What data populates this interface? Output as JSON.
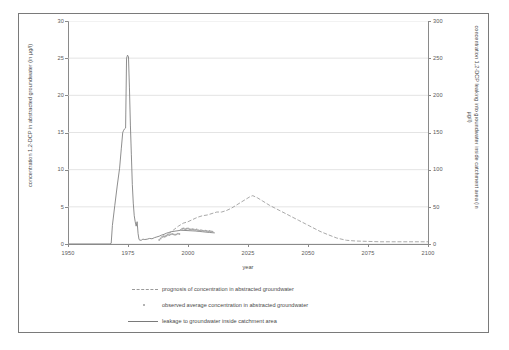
{
  "chart_data": {
    "type": "line",
    "title": "",
    "xlabel": "year",
    "ylabel": "concentration 1,2-DCP in abstracted groundwater (in µg/l)",
    "y2label": "concentration 1,2-DCP leaking into groundwater inside catchment area (in µg/l)",
    "xlim": [
      1950,
      2100
    ],
    "ylim": [
      0,
      30
    ],
    "y2lim": [
      0,
      300
    ],
    "grid": true,
    "legend_position": "below-plot",
    "xticks": [
      1950,
      1975,
      2000,
      2025,
      2050,
      2075,
      2100
    ],
    "xtick_labels": [
      "1950",
      "1975",
      "2000",
      "2025",
      "2050",
      "2075",
      "2100"
    ],
    "yticks": [
      0,
      5,
      10,
      15,
      20,
      25,
      30
    ],
    "ytick_labels": [
      "0",
      "5",
      "10",
      "15",
      "20",
      "25",
      "30"
    ],
    "y2ticks": [
      0,
      50,
      100,
      150,
      200,
      250,
      300
    ],
    "y2tick_labels": [
      "0",
      "50",
      "100",
      "150",
      "200",
      "250",
      "300"
    ],
    "series": [
      {
        "name": "leakage to groundwater inside catchment area",
        "style": "solid",
        "color": "#7a7a7a",
        "axis": "right",
        "x": [
          1950,
          1967.5,
          1968,
          1968.5,
          1969.5,
          1970.5,
          1971.5,
          1972.2,
          1972.8,
          1973.2,
          1973.6,
          1974.0,
          1974.4,
          1974.8,
          1975.2,
          1975.6,
          1976.0,
          1976.4,
          1976.8,
          1977.2,
          1977.6,
          1978.0,
          1978.4,
          1978.8,
          1979.2,
          1979.6,
          1980.0,
          1980.6,
          1981.2,
          1982.0,
          1983.0,
          1984.0,
          1985.0,
          1986.0,
          1987.0,
          1988.0,
          1989.0,
          1990.0,
          1991.0,
          1992.0,
          1993.0,
          1995.0,
          1997.0,
          2000.0,
          2003.0,
          2006.0,
          2009.0,
          2011.0
        ],
        "values": [
          0,
          0,
          1.0,
          25,
          52,
          78,
          102,
          128,
          150,
          153,
          155,
          156,
          250,
          254,
          252,
          210,
          160,
          120,
          80,
          55,
          38,
          30,
          24,
          30,
          14,
          6.0,
          5.0,
          5.2,
          6.5,
          6.0,
          6.5,
          7.5,
          7.0,
          8.5,
          9.5,
          10.5,
          12.0,
          13.0,
          14.5,
          15.5,
          16.5,
          17.5,
          18.5,
          18.0,
          17.5,
          16.5,
          15.5,
          15.0
        ]
      },
      {
        "name": "prognosis of concentration in abstracted groundwater",
        "style": "dashed",
        "color": "#9a9a9a",
        "axis": "left",
        "x": [
          1990,
          1992,
          1994,
          1996,
          1998,
          2000,
          2002,
          2004,
          2006,
          2008,
          2010,
          2012,
          2014,
          2016,
          2018,
          2020,
          2022,
          2024,
          2026,
          2027,
          2029,
          2031,
          2034,
          2037,
          2040,
          2043,
          2046,
          2049,
          2052,
          2055,
          2058,
          2062,
          2066,
          2070,
          2080,
          2090,
          2100
        ],
        "values": [
          0.9,
          1.4,
          1.9,
          2.4,
          2.8,
          3.0,
          3.3,
          3.6,
          3.8,
          3.9,
          4.1,
          4.3,
          4.3,
          4.5,
          4.8,
          5.2,
          5.6,
          6.0,
          6.4,
          6.5,
          6.2,
          5.8,
          5.2,
          4.7,
          4.2,
          3.7,
          3.2,
          2.7,
          2.2,
          1.7,
          1.3,
          0.8,
          0.5,
          0.4,
          0.3,
          0.3,
          0.3
        ]
      },
      {
        "name": "observed average concentration in abstracted groundwater",
        "style": "dots",
        "color": "#a8a8a8",
        "axis": "left",
        "x": [
          1988.0,
          1988.6,
          1989.2,
          1989.8,
          1990.4,
          1991.0,
          1991.6,
          1992.2,
          1992.8,
          1993.4,
          1994.0,
          1994.6,
          1995.2,
          1995.8,
          1996.4,
          1997.0,
          1997.6,
          1998.2,
          1998.8,
          1999.4,
          2000.0,
          2000.6,
          2001.2,
          2001.8,
          2002.4,
          2003.0,
          2003.6,
          2004.2,
          2004.8,
          2005.4,
          2006.0,
          2006.6,
          2007.2,
          2007.8,
          2008.4,
          2009.0,
          2009.6,
          2010.2
        ],
        "values": [
          0.55,
          0.75,
          0.95,
          1.05,
          1.0,
          1.1,
          1.25,
          1.2,
          1.3,
          1.35,
          1.3,
          1.25,
          1.3,
          1.4,
          1.35,
          1.9,
          2.05,
          2.1,
          2.0,
          2.05,
          2.1,
          2.0,
          1.95,
          2.0,
          1.95,
          1.9,
          1.95,
          1.85,
          1.8,
          1.85,
          1.8,
          1.75,
          1.8,
          1.75,
          1.7,
          1.75,
          1.7,
          1.65
        ]
      }
    ]
  },
  "legend": {
    "items": [
      {
        "label": "prognosis of concentration in abstracted groundwater",
        "marker": "dashed-line-icon"
      },
      {
        "label": "observed average concentration in abstracted groundwater",
        "marker": "dot-marker-icon"
      },
      {
        "label": "leakage to groundwater inside catchment area",
        "marker": "solid-line-icon"
      }
    ]
  },
  "colors": {
    "solid_series": "#7a7a7a",
    "dashed_series": "#9a9a9a",
    "dot_series": "#a8a8a8",
    "grid": "#d9d9d9",
    "axis": "#8a8a8a",
    "frame": "#7a7a7a"
  }
}
